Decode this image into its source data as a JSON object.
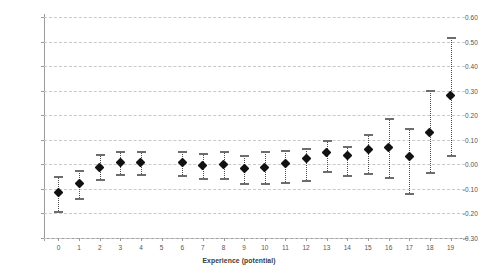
{
  "chart_data": {
    "type": "scatter",
    "title": "",
    "subtitle": "",
    "xlabel": "Experience (potential)",
    "ylabel": "",
    "xlim": [
      -0.7,
      19.7
    ],
    "ylim": [
      -0.3,
      0.6
    ],
    "grid": true,
    "legend": null,
    "marker": "filled-diamond",
    "errorbar_style": "dotted-with-caps",
    "x_tick_labels": [
      "0",
      "1",
      "2",
      "3",
      "4",
      "5",
      "6",
      "7",
      "8",
      "9",
      "10",
      "11",
      "12",
      "13",
      "14",
      "15",
      "16",
      "17",
      "18",
      "19"
    ],
    "y_tick_labels": [
      "-0.30",
      "-0.20",
      "-0.10",
      "0.00",
      "0.10",
      "0.20",
      "0.30",
      "0.40",
      "0.50",
      "0.60"
    ],
    "y_ticks": [
      -0.3,
      -0.2,
      -0.1,
      0.0,
      0.1,
      0.2,
      0.3,
      0.4,
      0.5,
      0.6
    ],
    "x": [
      0,
      1,
      2,
      3,
      4,
      5,
      6,
      7,
      8,
      9,
      10,
      11,
      12,
      13,
      14,
      15,
      16,
      17,
      18,
      19
    ],
    "values": [
      -0.115,
      -0.077,
      -0.011,
      0.008,
      0.009,
      null,
      0.006,
      -0.005,
      0.001,
      -0.019,
      -0.012,
      0.002,
      0.022,
      0.05,
      0.035,
      0.062,
      0.068,
      0.032,
      0.131,
      0.282
    ],
    "ci_low": [
      -0.191,
      -0.137,
      -0.061,
      -0.039,
      -0.039,
      null,
      -0.042,
      -0.057,
      -0.054,
      -0.075,
      -0.077,
      -0.073,
      -0.062,
      -0.027,
      -0.043,
      -0.035,
      -0.05,
      -0.115,
      -0.032,
      0.04
    ],
    "ci_high": [
      -0.047,
      -0.022,
      0.043,
      0.054,
      0.055,
      null,
      0.054,
      0.047,
      0.055,
      0.039,
      0.053,
      0.058,
      0.068,
      0.1,
      0.076,
      0.125,
      0.188,
      0.15,
      0.301,
      0.52
    ],
    "series": [
      {
        "name": "Coefficient estimate",
        "values": [
          -0.115,
          -0.077,
          -0.011,
          0.008,
          0.009,
          null,
          0.006,
          -0.005,
          0.001,
          -0.019,
          -0.012,
          0.002,
          0.022,
          0.05,
          0.035,
          0.062,
          0.068,
          0.032,
          0.131,
          0.282
        ]
      }
    ],
    "note": "X category 5 has no plotted point (omitted / reference category)"
  },
  "colors": {
    "background": "#ffffff",
    "grid": "#c9c9c9",
    "axis": "#9a9a9a",
    "marker": "#111111",
    "errorbar": "#4a4a4a",
    "tick_text": "#555555",
    "axis_title_text": "#3a3a3a"
  }
}
